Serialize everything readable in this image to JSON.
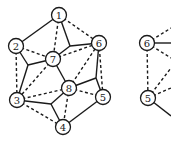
{
  "diagram": {
    "left_graph": {
      "nodes": [
        {
          "id": "1",
          "label": "1",
          "x": 59,
          "y": 15
        },
        {
          "id": "2",
          "label": "2",
          "x": 16,
          "y": 46
        },
        {
          "id": "6",
          "label": "6",
          "x": 99,
          "y": 43
        },
        {
          "id": "7",
          "label": "7",
          "x": 53,
          "y": 59
        },
        {
          "id": "8",
          "label": "8",
          "x": 69,
          "y": 88
        },
        {
          "id": "3",
          "label": "3",
          "x": 17,
          "y": 100
        },
        {
          "id": "5",
          "label": "5",
          "x": 103,
          "y": 97
        },
        {
          "id": "4",
          "label": "4",
          "x": 63,
          "y": 127
        }
      ],
      "junctions": [
        {
          "id": "j1",
          "x": 70,
          "y": 46
        },
        {
          "id": "j2",
          "x": 28,
          "y": 65
        },
        {
          "id": "j3",
          "x": 51,
          "y": 104
        },
        {
          "id": "j4",
          "x": 96,
          "y": 78
        }
      ],
      "solid_edges": [
        [
          "1",
          "2"
        ],
        [
          "1",
          "j1"
        ],
        [
          "7",
          "j1"
        ],
        [
          "j1",
          "6"
        ],
        [
          "2",
          "j2"
        ],
        [
          "j2",
          "7"
        ],
        [
          "j2",
          "3"
        ],
        [
          "3",
          "j3"
        ],
        [
          "j3",
          "4"
        ],
        [
          "j3",
          "8"
        ],
        [
          "8",
          "j4"
        ],
        [
          "j4",
          "6"
        ],
        [
          "j4",
          "5"
        ],
        [
          "7",
          "8"
        ],
        [
          "4",
          "5"
        ]
      ],
      "dashed_edges": [
        [
          "1",
          "7"
        ],
        [
          "1",
          "6"
        ],
        [
          "2",
          "7"
        ],
        [
          "2",
          "3"
        ],
        [
          "7",
          "6"
        ],
        [
          "7",
          "3"
        ],
        [
          "3",
          "8"
        ],
        [
          "3",
          "4"
        ],
        [
          "8",
          "4"
        ],
        [
          "8",
          "5"
        ],
        [
          "8",
          "6"
        ],
        [
          "6",
          "5"
        ]
      ]
    },
    "right_graph": {
      "nodes": [
        {
          "id": "6",
          "label": "6",
          "x": 147,
          "y": 43
        },
        {
          "id": "5",
          "label": "5",
          "x": 148,
          "y": 98
        }
      ]
    }
  }
}
